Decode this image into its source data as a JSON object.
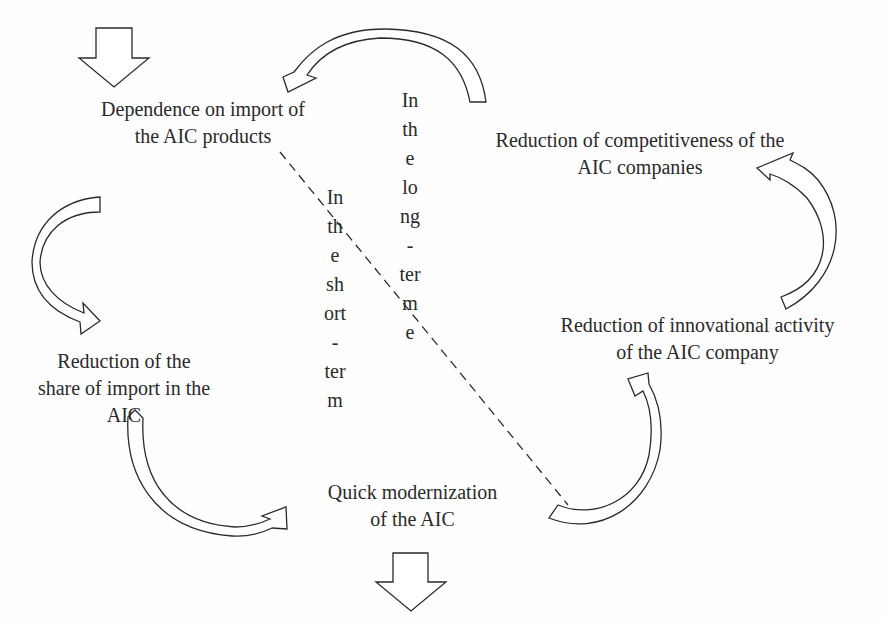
{
  "nodes": {
    "dependence": [
      "Dependence on import of",
      "the AIC products"
    ],
    "competitiveness": [
      "Reduction of competitiveness of the",
      "AIC companies"
    ],
    "innovation": [
      "Reduction of innovational activity",
      "of the AIC company"
    ],
    "share_import": [
      "Reduction of the",
      "share of import in the",
      "AIC"
    ],
    "modernization": [
      "Quick modernization",
      "of the AIC"
    ]
  },
  "labels": {
    "long_term": [
      "In",
      "th",
      "e",
      "lo",
      "ng",
      "-",
      "ter",
      "m",
      "e"
    ],
    "short_term": [
      "In",
      "th",
      "e",
      "sh",
      "ort",
      "-",
      "ter",
      "m"
    ]
  },
  "colors": {
    "stroke": "#2a2a2a",
    "text": "#2a2a2a",
    "background": "#fefefe"
  }
}
